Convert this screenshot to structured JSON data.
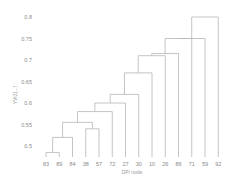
{
  "chart_data": {
    "type": "dendrogram",
    "title": "",
    "xlabel": "DPi node",
    "ylabel": "YVIZ(...)",
    "ylim": [
      0.47,
      0.82
    ],
    "yticks": [
      0.5,
      0.55,
      0.6,
      0.65,
      0.7,
      0.75,
      0.8
    ],
    "leaves": [
      "83",
      "89",
      "84",
      "38",
      "57",
      "72",
      "27",
      "30",
      "10",
      "26",
      "86",
      "71",
      "59",
      "92"
    ],
    "merges": [
      {
        "a": "83",
        "b": "89",
        "height": 0.485
      },
      {
        "a": "(83,89)",
        "b": "84",
        "height": 0.52
      },
      {
        "a": "38",
        "b": "57",
        "height": 0.54
      },
      {
        "a": "(83,89,84)",
        "b": "(38,57)",
        "height": 0.555
      },
      {
        "a": "cluster",
        "b": "72",
        "height": 0.58
      },
      {
        "a": "cluster",
        "b": "27",
        "height": 0.6
      },
      {
        "a": "cluster",
        "b": "30",
        "height": 0.62
      },
      {
        "a": "cluster",
        "b": "10",
        "height": 0.67
      },
      {
        "a": "cluster",
        "b": "26",
        "height": 0.71
      },
      {
        "a": "cluster",
        "b": "86",
        "height": 0.715
      },
      {
        "a": "cluster",
        "b": "71",
        "height": 0.75
      },
      {
        "a": "cluster",
        "b": "59",
        "height": 0.75
      },
      {
        "a": "cluster",
        "b": "92",
        "height": 0.8
      }
    ],
    "grid": false,
    "legend": null
  }
}
